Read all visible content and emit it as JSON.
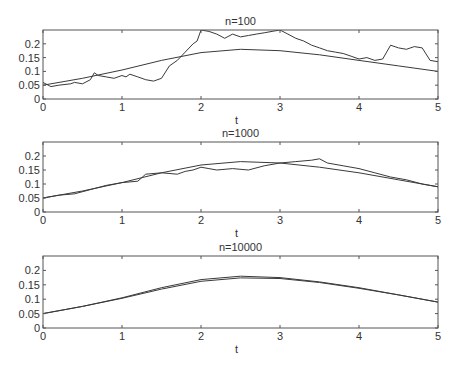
{
  "chart_data": [
    {
      "type": "line",
      "title": "n=100",
      "xlabel": "t",
      "ylabel": "",
      "xlim": [
        0,
        5
      ],
      "ylim": [
        0,
        0.25
      ],
      "xticks": [
        "0",
        "1",
        "2",
        "3",
        "4",
        "5"
      ],
      "yticks": [
        "0",
        "0.05",
        "0.1",
        "0.15",
        "0.2"
      ],
      "grid": false,
      "series": [
        {
          "name": "exact",
          "x": [
            0,
            0.5,
            1,
            1.5,
            2,
            2.5,
            3,
            3.5,
            4,
            4.5,
            5
          ],
          "values": [
            0.05,
            0.075,
            0.105,
            0.14,
            0.168,
            0.18,
            0.175,
            0.16,
            0.14,
            0.12,
            0.1
          ]
        },
        {
          "name": "estimate",
          "x": [
            0,
            0.1,
            0.2,
            0.35,
            0.4,
            0.5,
            0.6,
            0.65,
            0.7,
            0.8,
            0.9,
            1.0,
            1.05,
            1.1,
            1.2,
            1.3,
            1.4,
            1.5,
            1.6,
            1.7,
            1.8,
            1.9,
            1.95,
            2.0,
            2.1,
            2.2,
            2.3,
            2.4,
            2.5,
            2.6,
            2.7,
            2.8,
            2.9,
            3.0,
            3.1,
            3.2,
            3.3,
            3.4,
            3.5,
            3.6,
            3.7,
            3.8,
            3.9,
            4.0,
            4.1,
            4.2,
            4.3,
            4.4,
            4.5,
            4.6,
            4.7,
            4.8,
            4.9,
            5.0
          ],
          "values": [
            0.06,
            0.045,
            0.05,
            0.055,
            0.06,
            0.055,
            0.07,
            0.095,
            0.085,
            0.08,
            0.075,
            0.085,
            0.08,
            0.09,
            0.08,
            0.07,
            0.065,
            0.075,
            0.12,
            0.14,
            0.17,
            0.2,
            0.21,
            0.25,
            0.245,
            0.235,
            0.22,
            0.235,
            0.225,
            0.23,
            0.235,
            0.24,
            0.245,
            0.25,
            0.235,
            0.22,
            0.21,
            0.195,
            0.185,
            0.175,
            0.17,
            0.165,
            0.155,
            0.145,
            0.15,
            0.14,
            0.145,
            0.195,
            0.185,
            0.18,
            0.19,
            0.185,
            0.14,
            0.135
          ]
        }
      ]
    },
    {
      "type": "line",
      "title": "n=1000",
      "xlabel": "t",
      "ylabel": "",
      "xlim": [
        0,
        5
      ],
      "ylim": [
        0,
        0.25
      ],
      "xticks": [
        "0",
        "1",
        "2",
        "3",
        "4",
        "5"
      ],
      "yticks": [
        "0",
        "0.05",
        "0.1",
        "0.15",
        "0.2"
      ],
      "grid": false,
      "series": [
        {
          "name": "exact",
          "x": [
            0,
            0.5,
            1,
            1.5,
            2,
            2.5,
            3,
            3.5,
            4,
            4.5,
            5
          ],
          "values": [
            0.05,
            0.075,
            0.105,
            0.14,
            0.168,
            0.18,
            0.175,
            0.16,
            0.14,
            0.115,
            0.09
          ]
        },
        {
          "name": "estimate",
          "x": [
            0,
            0.2,
            0.4,
            0.6,
            0.8,
            1.0,
            1.2,
            1.3,
            1.5,
            1.7,
            1.8,
            1.9,
            2.0,
            2.1,
            2.2,
            2.4,
            2.6,
            2.8,
            3.0,
            3.2,
            3.4,
            3.5,
            3.6,
            3.8,
            4.0,
            4.2,
            4.4,
            4.6,
            4.8,
            5.0
          ],
          "values": [
            0.05,
            0.06,
            0.065,
            0.08,
            0.095,
            0.105,
            0.11,
            0.135,
            0.14,
            0.135,
            0.145,
            0.15,
            0.16,
            0.155,
            0.15,
            0.155,
            0.15,
            0.165,
            0.175,
            0.18,
            0.185,
            0.19,
            0.175,
            0.165,
            0.155,
            0.14,
            0.125,
            0.115,
            0.1,
            0.09
          ]
        }
      ]
    },
    {
      "type": "line",
      "title": "n=10000",
      "xlabel": "t",
      "ylabel": "",
      "xlim": [
        0,
        5
      ],
      "ylim": [
        0,
        0.25
      ],
      "xticks": [
        "0",
        "1",
        "2",
        "3",
        "4",
        "5"
      ],
      "yticks": [
        "0",
        "0.05",
        "0.1",
        "0.15",
        "0.2"
      ],
      "grid": false,
      "series": [
        {
          "name": "exact",
          "x": [
            0,
            0.5,
            1,
            1.5,
            2,
            2.5,
            3,
            3.5,
            4,
            4.5,
            5
          ],
          "values": [
            0.05,
            0.075,
            0.105,
            0.14,
            0.168,
            0.18,
            0.175,
            0.16,
            0.14,
            0.115,
            0.09
          ]
        },
        {
          "name": "estimate",
          "x": [
            0,
            0.5,
            1,
            1.5,
            2,
            2.5,
            3,
            3.5,
            4,
            4.5,
            5
          ],
          "values": [
            0.05,
            0.075,
            0.103,
            0.135,
            0.162,
            0.174,
            0.172,
            0.158,
            0.138,
            0.115,
            0.09
          ]
        }
      ]
    }
  ]
}
